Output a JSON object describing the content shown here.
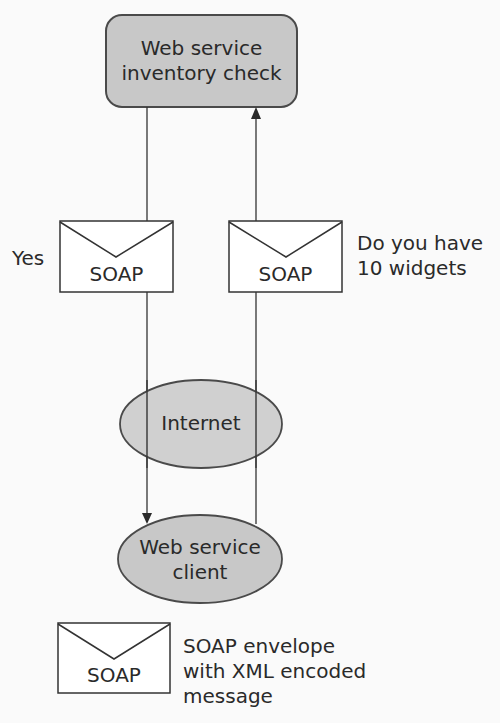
{
  "diagram": {
    "server": {
      "label_line1": "Web service",
      "label_line2": "inventory check"
    },
    "response_envelope": {
      "label": "SOAP",
      "caption": "Yes"
    },
    "request_envelope": {
      "label": "SOAP",
      "caption_line1": "Do you have",
      "caption_line2": "10 widgets"
    },
    "network": {
      "label": "Internet"
    },
    "client": {
      "label_line1": "Web service",
      "label_line2": "client"
    },
    "legend": {
      "envelope_label": "SOAP",
      "line1": "SOAP envelope",
      "line2": "with XML encoded",
      "line3": "message"
    },
    "colors": {
      "fill": "#c8c8c8",
      "stroke": "#4a4a4a",
      "envelope_fill": "#ffffff"
    }
  }
}
